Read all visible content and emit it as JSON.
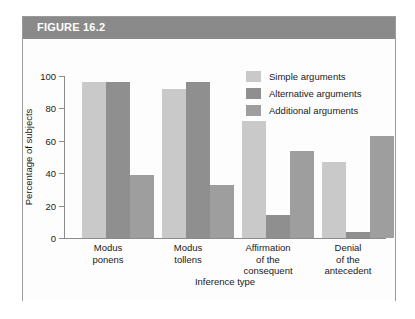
{
  "figure": {
    "header_label": "FIGURE 16.2"
  },
  "chart_data": {
    "type": "bar",
    "title": "",
    "xlabel": "Inference type",
    "ylabel": "Percentage of subjects",
    "ylim": [
      0,
      100
    ],
    "ytick_labels": [
      "0",
      "20",
      "40",
      "60",
      "80",
      "100"
    ],
    "yticks": [
      0,
      20,
      40,
      60,
      80,
      100
    ],
    "grid": false,
    "legend_position": "top-right",
    "categories": [
      "Modus\nponens",
      "Modus\ntollens",
      "Affirmation\nof the\nconsequent",
      "Denial\nof the\nantecedent"
    ],
    "category_lines": [
      [
        "Modus",
        "ponens"
      ],
      [
        "Modus",
        "tollens"
      ],
      [
        "Affirmation",
        "of the",
        "consequent"
      ],
      [
        "Denial",
        "of the",
        "antecedent"
      ]
    ],
    "series": [
      {
        "name": "Simple arguments",
        "color": "#c9c9c9",
        "values": [
          96,
          92,
          72,
          47
        ]
      },
      {
        "name": "Alternative arguments",
        "color": "#8f8f8f",
        "values": [
          96,
          96,
          14,
          4
        ]
      },
      {
        "name": "Additional arguments",
        "color": "#9e9e9e",
        "values": [
          39,
          33,
          54,
          63
        ]
      }
    ]
  }
}
